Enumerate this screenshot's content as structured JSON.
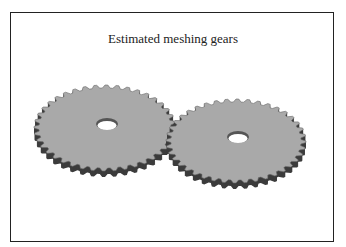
{
  "diagram": {
    "title": "Estimated meshing gears",
    "gears": [
      {
        "name": "left-gear",
        "cx": 105,
        "cy": 128,
        "rx": 71,
        "ry": 43,
        "teeth": 40,
        "hole_rx": 11,
        "hole_ry": 6
      },
      {
        "name": "right-gear",
        "cx": 236,
        "cy": 141,
        "rx": 70,
        "ry": 42,
        "teeth": 40,
        "hole_rx": 11,
        "hole_ry": 6
      }
    ],
    "colors": {
      "face": "#a9a9a9",
      "tooth_side": "#3c3c3c",
      "frame": "#222222",
      "hole": "#ffffff"
    }
  }
}
